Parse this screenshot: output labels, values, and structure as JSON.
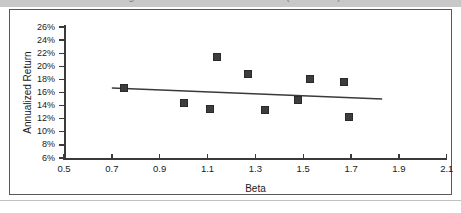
{
  "top_band": {
    "clipped_title": "Figure 4: Annualized Return vs. Beta (2001-2013)"
  },
  "chart_data": {
    "type": "scatter",
    "title": "",
    "xlabel": "Beta",
    "ylabel": "Annualized Return",
    "xlim": [
      0.5,
      2.1
    ],
    "ylim": [
      6,
      26
    ],
    "xticks": [
      "0.5",
      "0.7",
      "0.9",
      "1.1",
      "1.3",
      "1.5",
      "1.7",
      "1.9",
      "2.1"
    ],
    "xtick_values": [
      0.5,
      0.7,
      0.9,
      1.1,
      1.3,
      1.5,
      1.7,
      1.9,
      2.1
    ],
    "yticks": [
      "6%",
      "8%",
      "10%",
      "12%",
      "14%",
      "16%",
      "18%",
      "20%",
      "22%",
      "24%",
      "26%"
    ],
    "ytick_values": [
      6,
      8,
      10,
      12,
      14,
      16,
      18,
      20,
      22,
      24,
      26
    ],
    "grid": false,
    "legend": false,
    "marker": "square",
    "marker_color": "#3d3d3d",
    "points": [
      {
        "x": 0.75,
        "y": 16.7
      },
      {
        "x": 1.0,
        "y": 14.4
      },
      {
        "x": 1.11,
        "y": 13.5
      },
      {
        "x": 1.14,
        "y": 21.4
      },
      {
        "x": 1.27,
        "y": 18.8
      },
      {
        "x": 1.34,
        "y": 13.3
      },
      {
        "x": 1.48,
        "y": 14.9
      },
      {
        "x": 1.53,
        "y": 18.1
      },
      {
        "x": 1.67,
        "y": 17.6
      },
      {
        "x": 1.69,
        "y": 12.3
      }
    ],
    "trendline": {
      "type": "linear-fit",
      "color": "#3a3a3a",
      "x_start": 0.7,
      "y_start": 16.7,
      "x_end": 1.83,
      "y_end": 15.0
    }
  }
}
